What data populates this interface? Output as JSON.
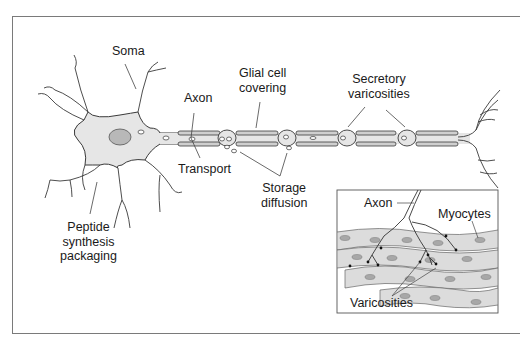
{
  "diagram": {
    "labels": {
      "soma": "Soma",
      "axon": "Axon",
      "glial_line1": "Glial cell",
      "glial_line2": "covering",
      "secretory_line1": "Secretory",
      "secretory_line2": "varicosities",
      "transport": "Transport",
      "storage_line1": "Storage",
      "storage_line2": "diffusion",
      "peptide_line1": "Peptide",
      "peptide_line2": "synthesis",
      "peptide_line3": "packaging"
    },
    "inset": {
      "axon": "Axon",
      "myocytes": "Myocytes",
      "varicosities": "Varicosities"
    },
    "colors": {
      "cell_fill": "#e6e6e6",
      "nucleus_fill": "#b8b8b8",
      "outline": "#3a3a3a",
      "glial_fill": "#cfcfcf",
      "frame": "#7a7a7a"
    }
  }
}
